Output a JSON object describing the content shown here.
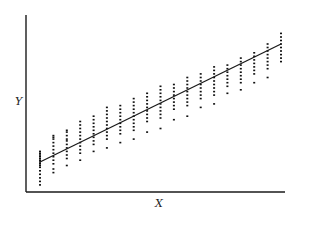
{
  "chart_data": {
    "type": "scatter",
    "title": "",
    "xlabel": "X",
    "ylabel": "Y",
    "grid": false,
    "legend": null,
    "ticks": "none",
    "xlim": [
      0,
      20
    ],
    "ylim": [
      0,
      20
    ],
    "regression_line": {
      "x0": 1,
      "y0": 3.4,
      "x1": 19,
      "y1": 16.8
    },
    "columns_x": [
      1,
      2,
      3,
      4,
      5,
      6,
      7,
      8,
      9,
      10,
      11,
      12,
      13,
      14,
      15,
      16,
      17,
      18,
      19
    ],
    "series": [
      {
        "name": "observations",
        "points_by_column": [
          [
            1.6,
            2.0,
            2.4,
            2.8,
            3.0,
            3.2,
            3.4,
            3.6,
            3.8,
            4.0,
            4.2,
            4.4,
            4.6,
            1.2,
            0.8
          ],
          [
            3.2,
            3.6,
            4.0,
            4.4,
            4.8,
            5.2,
            5.6,
            6.0,
            6.2,
            6.4,
            2.6,
            2.2
          ],
          [
            3.8,
            4.2,
            4.6,
            5.0,
            5.4,
            5.8,
            6.0,
            6.4,
            6.8,
            7.0,
            3.0
          ],
          [
            4.4,
            4.8,
            5.2,
            5.6,
            6.0,
            6.4,
            6.8,
            7.2,
            7.6,
            8.0,
            3.6
          ],
          [
            5.4,
            5.8,
            6.2,
            6.6,
            7.0,
            7.4,
            7.8,
            8.2,
            8.6,
            4.6
          ],
          [
            6.0,
            6.4,
            6.8,
            7.2,
            7.6,
            8.0,
            8.4,
            8.8,
            9.2,
            9.6,
            5.0
          ],
          [
            6.6,
            7.0,
            7.4,
            7.8,
            8.2,
            8.6,
            9.0,
            9.4,
            9.8,
            5.6
          ],
          [
            7.0,
            7.4,
            7.8,
            8.2,
            8.6,
            9.0,
            9.4,
            9.8,
            10.2,
            10.6,
            6.0
          ],
          [
            8.0,
            8.4,
            8.8,
            9.2,
            9.6,
            10.0,
            10.4,
            10.8,
            11.2,
            6.8
          ],
          [
            8.4,
            8.8,
            9.2,
            9.6,
            10.0,
            10.4,
            10.8,
            11.2,
            11.6,
            12.0,
            7.2
          ],
          [
            9.4,
            9.8,
            10.2,
            10.6,
            11.0,
            11.4,
            11.8,
            12.2,
            8.2
          ],
          [
            9.8,
            10.2,
            10.6,
            11.0,
            11.4,
            11.8,
            12.2,
            12.6,
            13.0,
            8.6
          ],
          [
            10.6,
            11.0,
            11.4,
            11.8,
            12.2,
            12.6,
            13.0,
            13.4,
            9.6
          ],
          [
            11.0,
            11.4,
            11.8,
            12.2,
            12.6,
            13.0,
            13.4,
            13.8,
            14.2,
            10.0
          ],
          [
            12.0,
            12.4,
            12.8,
            13.2,
            13.6,
            14.0,
            14.4,
            11.2
          ],
          [
            12.4,
            12.8,
            13.2,
            13.6,
            14.0,
            14.4,
            14.8,
            15.2,
            11.6
          ],
          [
            13.4,
            13.8,
            14.2,
            14.6,
            15.0,
            15.4,
            15.8,
            12.4
          ],
          [
            14.0,
            14.4,
            14.8,
            15.2,
            15.6,
            16.0,
            16.4,
            16.8,
            13.0
          ],
          [
            14.8,
            15.2,
            15.6,
            16.0,
            16.4,
            16.8,
            17.2,
            17.6,
            18.0
          ]
        ]
      }
    ]
  },
  "plot": {
    "x_label": "X",
    "y_label": "Y",
    "colors": {
      "axis": "#1a1a1a",
      "points": "#111111",
      "line": "#1a1a1a",
      "background": "#ffffff"
    }
  }
}
